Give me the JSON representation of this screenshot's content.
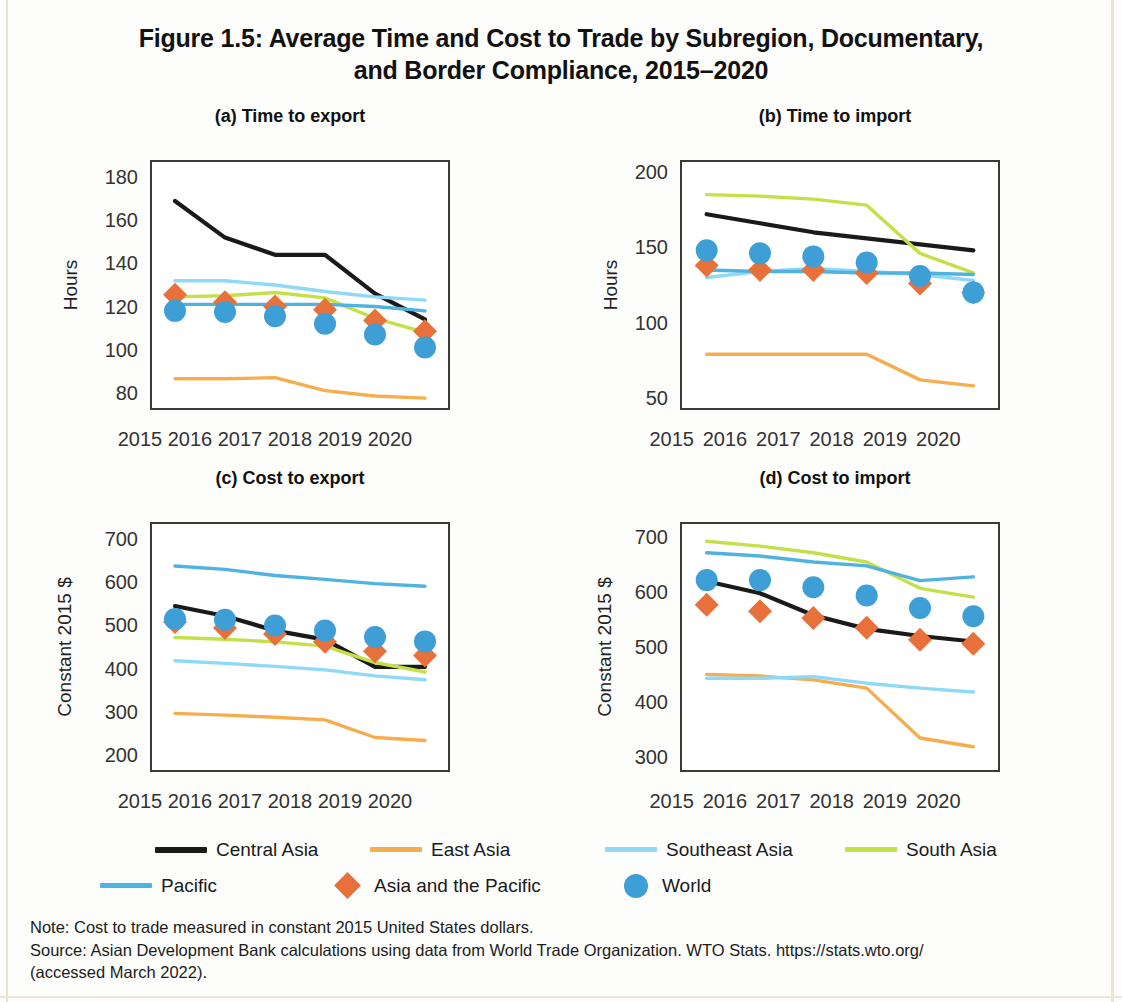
{
  "figure": {
    "title": "Figure 1.5: Average Time and Cost to Trade by Subregion, Documentary, and Border Compliance, 2015–2020",
    "title_line1": "Figure 1.5: Average Time and Cost to Trade by Subregion, Documentary,",
    "title_line2": "and Border Compliance, 2015–2020"
  },
  "legend": {
    "position": "bottom",
    "entries": [
      {
        "label": "Central Asia",
        "color": "#1a1a1a",
        "marker": "line"
      },
      {
        "label": "East Asia",
        "color": "#f5ad4e",
        "marker": "line"
      },
      {
        "label": "Southeast Asia",
        "color": "#8ed8f8",
        "marker": "line"
      },
      {
        "label": "South Asia",
        "color": "#c4e048",
        "marker": "line"
      },
      {
        "label": "Pacific",
        "color": "#4fb3e0",
        "marker": "line"
      },
      {
        "label": "Asia and the Pacific",
        "color": "#e8703a",
        "marker": "diamond"
      },
      {
        "label": "World",
        "color": "#3d9fd6",
        "marker": "circle"
      }
    ]
  },
  "notes": {
    "note": "Note: Cost to trade measured in constant 2015 United States dollars.",
    "source_line1": "Source: Asian Development Bank calculations using data from World Trade Organization. WTO Stats.  https://stats.wto.org/",
    "source_line2": "(accessed March 2022)."
  },
  "chart_data": [
    {
      "id": "a",
      "type": "line",
      "title": "(a) Time to export",
      "xlabel": "",
      "ylabel": "Hours",
      "x": [
        "2015",
        "2016",
        "2017",
        "2018",
        "2019",
        "2020"
      ],
      "ylim": [
        72,
        188
      ],
      "yticks": [
        80,
        100,
        120,
        140,
        160,
        180
      ],
      "grid": false,
      "series": [
        {
          "name": "Central Asia",
          "color": "#1a1a1a",
          "marker": "line",
          "values": [
            169,
            152,
            144,
            144,
            126,
            114
          ]
        },
        {
          "name": "East Asia",
          "color": "#f5ad4e",
          "marker": "line",
          "values": [
            86.5,
            86.5,
            87,
            81,
            78.5,
            77.5
          ]
        },
        {
          "name": "Southeast Asia",
          "color": "#8ed8f8",
          "marker": "line",
          "values": [
            132,
            132,
            130,
            127,
            124.5,
            123
          ]
        },
        {
          "name": "South Asia",
          "color": "#c4e048",
          "marker": "line",
          "values": [
            124.5,
            125,
            126.5,
            124,
            114.5,
            108
          ]
        },
        {
          "name": "Pacific",
          "color": "#4fb3e0",
          "marker": "line",
          "values": [
            121,
            121,
            121,
            121,
            120,
            118
          ]
        },
        {
          "name": "Asia and the Pacific",
          "color": "#e8703a",
          "marker": "diamond",
          "values": [
            125.5,
            122,
            120,
            118.5,
            113.5,
            108.5
          ]
        },
        {
          "name": "World",
          "color": "#3d9fd6",
          "marker": "circle",
          "values": [
            118,
            117.5,
            115.5,
            112,
            107,
            101
          ]
        }
      ]
    },
    {
      "id": "b",
      "type": "line",
      "title": "(b) Time to import",
      "xlabel": "",
      "ylabel": "Hours",
      "x": [
        "2015",
        "2016",
        "2017",
        "2018",
        "2019",
        "2020"
      ],
      "ylim": [
        42,
        208
      ],
      "yticks": [
        50,
        100,
        150,
        200
      ],
      "grid": false,
      "series": [
        {
          "name": "Central Asia",
          "color": "#1a1a1a",
          "marker": "line",
          "values": [
            172,
            166,
            160,
            156,
            152,
            148
          ]
        },
        {
          "name": "East Asia",
          "color": "#f5ad4e",
          "marker": "line",
          "values": [
            79,
            79,
            79,
            79,
            62,
            58
          ]
        },
        {
          "name": "Southeast Asia",
          "color": "#8ed8f8",
          "marker": "line",
          "values": [
            130,
            134,
            136,
            134,
            132,
            128
          ]
        },
        {
          "name": "South Asia",
          "color": "#c4e048",
          "marker": "line",
          "values": [
            185,
            184,
            182,
            178,
            146,
            133
          ]
        },
        {
          "name": "Pacific",
          "color": "#4fb3e0",
          "marker": "line",
          "values": [
            135,
            134,
            134,
            133,
            133,
            132
          ]
        },
        {
          "name": "Asia and the Pacific",
          "color": "#e8703a",
          "marker": "diamond",
          "values": [
            138,
            135,
            135,
            133,
            126,
            120
          ]
        },
        {
          "name": "World",
          "color": "#3d9fd6",
          "marker": "circle",
          "values": [
            148,
            146,
            144,
            140,
            131,
            120
          ]
        }
      ]
    },
    {
      "id": "c",
      "type": "line",
      "title": "(c) Cost to export",
      "xlabel": "",
      "ylabel": "Constant 2015 $",
      "x": [
        "2015",
        "2016",
        "2017",
        "2018",
        "2019",
        "2020"
      ],
      "ylim": [
        160,
        740
      ],
      "yticks": [
        200,
        300,
        400,
        500,
        600,
        700
      ],
      "grid": false,
      "series": [
        {
          "name": "Central Asia",
          "color": "#1a1a1a",
          "marker": "line",
          "values": [
            545,
            522,
            488,
            467,
            404,
            404
          ]
        },
        {
          "name": "East Asia",
          "color": "#f5ad4e",
          "marker": "line",
          "values": [
            296,
            292,
            287,
            281,
            240,
            233
          ]
        },
        {
          "name": "Southeast Asia",
          "color": "#8ed8f8",
          "marker": "line",
          "values": [
            418,
            412,
            405,
            397,
            383,
            374
          ]
        },
        {
          "name": "South Asia",
          "color": "#c4e048",
          "marker": "line",
          "values": [
            472,
            468,
            462,
            452,
            414,
            392
          ]
        },
        {
          "name": "Pacific",
          "color": "#4fb3e0",
          "marker": "line",
          "values": [
            638,
            630,
            616,
            607,
            597,
            591
          ]
        },
        {
          "name": "Asia and the Pacific",
          "color": "#e8703a",
          "marker": "diamond",
          "values": [
            508,
            494,
            480,
            462,
            440,
            430
          ]
        },
        {
          "name": "World",
          "color": "#3d9fd6",
          "marker": "circle",
          "values": [
            515,
            513,
            500,
            488,
            473,
            463
          ]
        }
      ]
    },
    {
      "id": "d",
      "type": "line",
      "title": "(d) Cost to import",
      "xlabel": "",
      "ylabel": "Constant 2015 $",
      "x": [
        "2015",
        "2016",
        "2017",
        "2018",
        "2019",
        "2020"
      ],
      "ylim": [
        272,
        728
      ],
      "yticks": [
        300,
        400,
        500,
        600,
        700
      ],
      "grid": false,
      "series": [
        {
          "name": "Central Asia",
          "color": "#1a1a1a",
          "marker": "line",
          "values": [
            620,
            598,
            558,
            533,
            520,
            510
          ]
        },
        {
          "name": "East Asia",
          "color": "#f5ad4e",
          "marker": "line",
          "values": [
            450,
            447,
            440,
            425,
            334,
            318
          ]
        },
        {
          "name": "Southeast Asia",
          "color": "#8ed8f8",
          "marker": "line",
          "values": [
            443,
            443,
            446,
            434,
            425,
            418
          ]
        },
        {
          "name": "South Asia",
          "color": "#c4e048",
          "marker": "line",
          "values": [
            693,
            684,
            672,
            655,
            607,
            591
          ]
        },
        {
          "name": "Pacific",
          "color": "#4fb3e0",
          "marker": "line",
          "values": [
            672,
            666,
            655,
            648,
            621,
            628
          ]
        },
        {
          "name": "Asia and the Pacific",
          "color": "#e8703a",
          "marker": "diamond",
          "values": [
            577,
            565,
            553,
            535,
            513,
            506
          ]
        },
        {
          "name": "World",
          "color": "#3d9fd6",
          "marker": "circle",
          "values": [
            622,
            622,
            609,
            594,
            571,
            556
          ]
        }
      ]
    }
  ]
}
